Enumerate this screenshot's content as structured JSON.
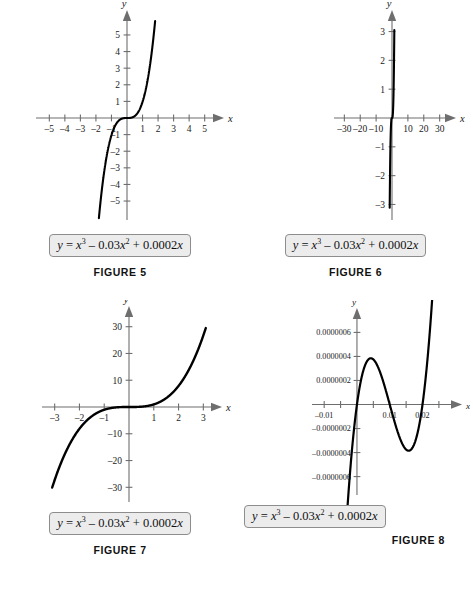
{
  "page": {
    "background": "#ffffff",
    "equation_text": "y = x3 - 0.03x2 + 0.0002x",
    "curve_color": "#000000",
    "axis_color": "#6e6e6e",
    "box_fill": "#ececed",
    "box_border": "#8d8d8d"
  },
  "figures": [
    {
      "id": "figure-5",
      "caption": "FIGURE 5",
      "equation": {
        "lhs": "y",
        "eq": "=",
        "term1_base": "x",
        "term1_exp": "3",
        "term2_sign": "–",
        "term2_coef": "0.03",
        "term2_base": "x",
        "term2_exp": "2",
        "term3_sign": "+",
        "term3_coef": "0.0002",
        "term3_base": "x"
      },
      "chart_data": {
        "type": "line",
        "title": "FIGURE 5",
        "xlabel": "x",
        "ylabel": "y",
        "xlim": [
          -5.6,
          5.6
        ],
        "ylim": [
          -5.9,
          5.9
        ],
        "xticks": [
          -5,
          -4,
          -3,
          -2,
          -1,
          1,
          2,
          3,
          4,
          5
        ],
        "yticks": [
          -5,
          -4,
          -3,
          -2,
          -1,
          1,
          2,
          3,
          4,
          5
        ],
        "xticklabels": [
          "–5",
          "–4",
          "–3",
          "–2",
          "–1",
          "1",
          "2",
          "3",
          "4",
          "5"
        ],
        "yticklabels": [
          "–5",
          "–4",
          "–3",
          "–2",
          "–1",
          "1",
          "2",
          "3",
          "4",
          "5"
        ],
        "grid": false,
        "legend": "none",
        "function": "x^3 - 0.03*x^2 + 0.0002*x",
        "x_domain": [
          -1.81,
          1.81
        ]
      }
    },
    {
      "id": "figure-6",
      "caption": "FIGURE 6",
      "equation": {
        "lhs": "y",
        "eq": "=",
        "term1_base": "x",
        "term1_exp": "3",
        "term2_sign": "–",
        "term2_coef": "0.03",
        "term2_base": "x",
        "term2_exp": "2",
        "term3_sign": "+",
        "term3_coef": "0.0002",
        "term3_base": "x"
      },
      "chart_data": {
        "type": "line",
        "title": "FIGURE 6",
        "xlabel": "x",
        "ylabel": "y",
        "xlim": [
          -34,
          34
        ],
        "ylim": [
          -3.4,
          3.4
        ],
        "xticks": [
          -30,
          -20,
          -10,
          10,
          20,
          30
        ],
        "yticks": [
          -3,
          -2,
          -1,
          1,
          2,
          3
        ],
        "xticklabels": [
          "–30",
          "–20",
          "–10",
          "10",
          "20",
          "30"
        ],
        "yticklabels": [
          "–3",
          "–2",
          "–1",
          "1",
          "2",
          "3"
        ],
        "grid": false,
        "legend": "none",
        "function": "x^3 - 0.03*x^2 + 0.0002*x",
        "x_domain": [
          -1.45,
          1.46
        ]
      }
    },
    {
      "id": "figure-7",
      "caption": "FIGURE 7",
      "equation": {
        "lhs": "y",
        "eq": "=",
        "term1_base": "x",
        "term1_exp": "3",
        "term2_sign": "–",
        "term2_coef": "0.03",
        "term2_base": "x",
        "term2_exp": "2",
        "term3_sign": "+",
        "term3_coef": "0.0002",
        "term3_base": "x"
      },
      "chart_data": {
        "type": "line",
        "title": "FIGURE 7",
        "xlabel": "x",
        "ylabel": "y",
        "xlim": [
          -3.35,
          3.35
        ],
        "ylim": [
          -34,
          34
        ],
        "xticks": [
          -3,
          -2,
          -1,
          1,
          2,
          3
        ],
        "yticks": [
          -30,
          -20,
          -10,
          10,
          20,
          30
        ],
        "xticklabels": [
          "–3",
          "–2",
          "–1",
          "1",
          "2",
          "3"
        ],
        "yticklabels": [
          "–30",
          "–20",
          "–10",
          "10",
          "20",
          "30"
        ],
        "grid": false,
        "legend": "none",
        "function": "x^3 - 0.03*x^2 + 0.0002*x",
        "x_domain": [
          -3.1,
          3.1
        ]
      }
    },
    {
      "id": "figure-8",
      "caption": "FIGURE 8",
      "equation": {
        "lhs": "y",
        "eq": "=",
        "term1_base": "x",
        "term1_exp": "3",
        "term2_sign": "–",
        "term2_coef": "0.03",
        "term2_base": "x",
        "term2_exp": "2",
        "term3_sign": "+",
        "term3_coef": "0.0002",
        "term3_base": "x"
      },
      "chart_data": {
        "type": "line",
        "title": "FIGURE 8",
        "xlabel": "x",
        "ylabel": "y",
        "xlim": [
          -0.0125,
          0.029
        ],
        "ylim": [
          -7.2e-07,
          7.2e-07
        ],
        "xticks": [
          -0.01,
          -0.005,
          0.005,
          0.01,
          0.015,
          0.02,
          0.025
        ],
        "yticks": [
          -6e-07,
          -4e-07,
          -2e-07,
          2e-07,
          4e-07,
          6e-07
        ],
        "xticklabels": [
          "–0.01",
          "",
          "",
          "0.01",
          "",
          "0.02",
          ""
        ],
        "yticklabels": [
          "–0.0000006",
          "–0.0000004",
          "–0.0000002",
          "0.0000002",
          "0.0000004",
          "0.0000006"
        ],
        "grid": false,
        "legend": "none",
        "function": "x^3 - 0.03*x^2 + 0.0002*x",
        "x_domain": [
          -0.0082,
          0.0272
        ],
        "features": {
          "local_max_x": 0.004,
          "local_max_y": 4e-07,
          "local_min_x": 0.016,
          "local_min_y": -4e-07,
          "root_mid_x": 0.01,
          "root_right_x": 0.02
        }
      }
    }
  ]
}
